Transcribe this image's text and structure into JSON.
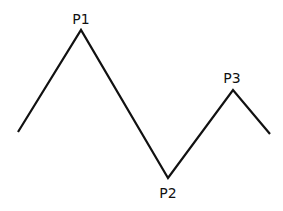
{
  "diagram": {
    "type": "zigzag-line",
    "line_color": "#111111",
    "background": "#ffffff",
    "points": [
      {
        "x": 18,
        "y": 132
      },
      {
        "x": 81,
        "y": 30
      },
      {
        "x": 168,
        "y": 178
      },
      {
        "x": 233,
        "y": 90
      },
      {
        "x": 270,
        "y": 134
      }
    ],
    "labels": [
      {
        "text": "P1",
        "x": 81,
        "y": 24
      },
      {
        "text": "P2",
        "x": 168,
        "y": 198
      },
      {
        "text": "P3",
        "x": 232,
        "y": 83
      }
    ]
  }
}
